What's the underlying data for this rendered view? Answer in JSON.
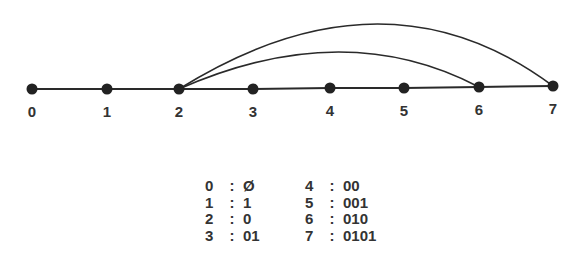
{
  "diagram": {
    "line_color": "#2a2a2a",
    "nodes": [
      {
        "id": "0",
        "label": "0",
        "x": 32,
        "y": 89
      },
      {
        "id": "1",
        "label": "1",
        "x": 107,
        "y": 89
      },
      {
        "id": "2",
        "label": "2",
        "x": 179,
        "y": 89
      },
      {
        "id": "3",
        "label": "3",
        "x": 253,
        "y": 89
      },
      {
        "id": "4",
        "label": "4",
        "x": 330,
        "y": 88
      },
      {
        "id": "5",
        "label": "5",
        "x": 404,
        "y": 88
      },
      {
        "id": "6",
        "label": "6",
        "x": 479,
        "y": 87
      },
      {
        "id": "7",
        "label": "7",
        "x": 553,
        "y": 86
      }
    ],
    "path_edges": [
      [
        "0",
        "1"
      ],
      [
        "1",
        "2"
      ],
      [
        "2",
        "3"
      ],
      [
        "3",
        "4"
      ],
      [
        "4",
        "5"
      ],
      [
        "5",
        "6"
      ],
      [
        "6",
        "7"
      ]
    ],
    "arc_edges": [
      {
        "from": "2",
        "to": "6",
        "peak_y": 52
      },
      {
        "from": "2",
        "to": "7",
        "peak_y": 24
      }
    ]
  },
  "codes": {
    "left": [
      {
        "key": "0",
        "sep": ":",
        "value": "Ø"
      },
      {
        "key": "1",
        "sep": ":",
        "value": "1"
      },
      {
        "key": "2",
        "sep": ":",
        "value": "0"
      },
      {
        "key": "3",
        "sep": ":",
        "value": "01"
      }
    ],
    "right": [
      {
        "key": "4",
        "sep": ":",
        "value": "00"
      },
      {
        "key": "5",
        "sep": ":",
        "value": "001"
      },
      {
        "key": "6",
        "sep": ":",
        "value": "010"
      },
      {
        "key": "7",
        "sep": ":",
        "value": "0101"
      }
    ]
  }
}
